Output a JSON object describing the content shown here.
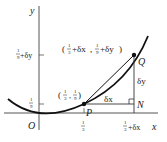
{
  "figure": {
    "function": "y = x^2",
    "axes": {
      "x_label": "x",
      "y_label": "y",
      "origin_label": "O"
    },
    "ticks": {
      "x": [
        {
          "num": "1",
          "den": "3",
          "suffix": ""
        },
        {
          "num": "1",
          "den": "3",
          "suffix": "+δx"
        }
      ],
      "y": [
        {
          "num": "1",
          "den": "9",
          "suffix": ""
        },
        {
          "num": "1",
          "den": "9",
          "suffix": "+δy"
        }
      ]
    },
    "points": {
      "P": {
        "label": "P",
        "coord_text": "( 1/3 , 1/9 )"
      },
      "Q": {
        "label": "Q",
        "coord_text": "( 1/3+δx , 1/9+δy)"
      },
      "N": {
        "label": "N"
      }
    },
    "segment_labels": {
      "dx": "δx",
      "dy": "δy"
    },
    "colors": {
      "ink": "#222222",
      "axis": "#555555",
      "background": "#ffffff"
    }
  }
}
